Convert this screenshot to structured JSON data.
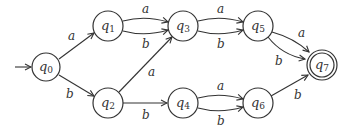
{
  "diagram": {
    "type": "finite-automaton",
    "start_state": "q0",
    "accept_states": [
      "q7"
    ],
    "states": [
      {
        "id": "q0",
        "base": "q",
        "sub": "0",
        "x": 46,
        "y": 67
      },
      {
        "id": "q1",
        "base": "q",
        "sub": "1",
        "x": 108,
        "y": 26
      },
      {
        "id": "q2",
        "base": "q",
        "sub": "2",
        "x": 108,
        "y": 103
      },
      {
        "id": "q3",
        "base": "q",
        "sub": "3",
        "x": 183,
        "y": 26
      },
      {
        "id": "q4",
        "base": "q",
        "sub": "4",
        "x": 183,
        "y": 103
      },
      {
        "id": "q5",
        "base": "q",
        "sub": "5",
        "x": 258,
        "y": 26
      },
      {
        "id": "q6",
        "base": "q",
        "sub": "6",
        "x": 258,
        "y": 103
      },
      {
        "id": "q7",
        "base": "q",
        "sub": "7",
        "x": 322,
        "y": 65
      }
    ],
    "transitions": [
      {
        "from": "q0",
        "to": "q1",
        "label": "a"
      },
      {
        "from": "q0",
        "to": "q2",
        "label": "b"
      },
      {
        "from": "q1",
        "to": "q3",
        "label": "a"
      },
      {
        "from": "q1",
        "to": "q3",
        "label": "b"
      },
      {
        "from": "q2",
        "to": "q3",
        "label": "a"
      },
      {
        "from": "q2",
        "to": "q4",
        "label": "b"
      },
      {
        "from": "q3",
        "to": "q5",
        "label": "a"
      },
      {
        "from": "q3",
        "to": "q5",
        "label": "b"
      },
      {
        "from": "q4",
        "to": "q6",
        "label": "a"
      },
      {
        "from": "q4",
        "to": "q6",
        "label": "b"
      },
      {
        "from": "q5",
        "to": "q7",
        "label": "a"
      },
      {
        "from": "q5",
        "to": "q7",
        "label": "b"
      },
      {
        "from": "q6",
        "to": "q7",
        "label": "b"
      }
    ]
  }
}
